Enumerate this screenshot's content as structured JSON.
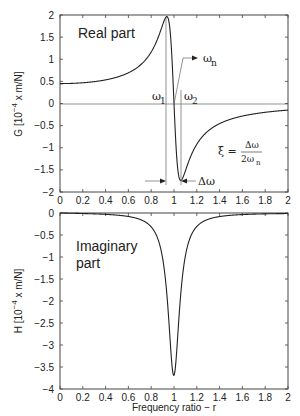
{
  "chart_data": [
    {
      "type": "line",
      "title": "",
      "panel_label": "Real part",
      "xlabel": "",
      "ylabel": "G [10^-4 x m/N]",
      "ylabel_parts": {
        "prefix": "G [10",
        "exp": "−4",
        "suffix": " x m/N]"
      },
      "xlim": [
        0,
        2
      ],
      "ylim": [
        -2,
        2
      ],
      "xticks": [
        "0",
        "0.2",
        "0.4",
        "0.6",
        "0.8",
        "1",
        "1.2",
        "1.4",
        "1.6",
        "1.8",
        "2"
      ],
      "yticks": [
        "2",
        "1.5",
        "1",
        "0.5",
        "0",
        "−0.5",
        "−1",
        "−1.5",
        "−2"
      ],
      "grid": false,
      "zero_line": true,
      "model": {
        "static_compliance": 0.45,
        "damping_ratio": 0.061
      },
      "series": [
        {
          "name": "G (real part of receptance)",
          "x": [
            0,
            0.2,
            0.4,
            0.6,
            0.8,
            0.9,
            0.93,
            0.96,
            1.0,
            1.04,
            1.07,
            1.1,
            1.2,
            1.4,
            1.6,
            1.8,
            2.0
          ],
          "y": [
            0.45,
            0.47,
            0.54,
            0.7,
            1.19,
            1.78,
            1.95,
            1.6,
            0.0,
            -1.62,
            -1.78,
            -1.66,
            -1.0,
            -0.46,
            -0.29,
            -0.2,
            -0.15
          ]
        }
      ],
      "annotations": [
        {
          "text": "ω",
          "sub": "n",
          "kind": "arrow",
          "at": [
            1.0,
            0
          ]
        },
        {
          "text": "ω",
          "sub": "1",
          "kind": "vline",
          "x": 0.93
        },
        {
          "text": "ω",
          "sub": "2",
          "kind": "vline",
          "x": 1.06
        },
        {
          "text": "Δω",
          "kind": "double-arrow",
          "from": 0.93,
          "to": 1.06
        },
        {
          "text": "ξ = Δω / 2ωn",
          "numerator": "Δω",
          "denominator": "2ω",
          "denominator_sub": "n",
          "lhs": "ξ ="
        }
      ]
    },
    {
      "type": "line",
      "title": "",
      "panel_label_line1": "Imaginary",
      "panel_label_line2": "part",
      "xlabel": "Frequency ratio  −  r",
      "ylabel": "H [10^-4 x m/N]",
      "ylabel_parts": {
        "prefix": "H [10",
        "exp": "−4",
        "suffix": " x m/N]"
      },
      "xlim": [
        0,
        2
      ],
      "ylim": [
        -4,
        0
      ],
      "xticks": [
        "0",
        "0.2",
        "0.4",
        "0.6",
        "0.8",
        "1",
        "1.2",
        "1.4",
        "1.6",
        "1.8",
        "2"
      ],
      "yticks": [
        "0",
        "−0.5",
        "−1",
        "−1.5",
        "−2",
        "−2.5",
        "−3",
        "−3.5",
        "−4"
      ],
      "grid": false,
      "model": {
        "static_compliance": 0.45,
        "damping_ratio": 0.061
      },
      "series": [
        {
          "name": "H (imaginary part of receptance)",
          "x": [
            0,
            0.2,
            0.4,
            0.6,
            0.8,
            0.9,
            0.95,
            1.0,
            1.05,
            1.1,
            1.2,
            1.4,
            1.6,
            1.8,
            2.0
          ],
          "y": [
            0.0,
            -0.01,
            -0.02,
            -0.05,
            -0.17,
            -0.53,
            -1.43,
            -3.69,
            -1.43,
            -0.52,
            -0.17,
            -0.04,
            -0.02,
            -0.01,
            -0.01
          ]
        }
      ]
    }
  ]
}
